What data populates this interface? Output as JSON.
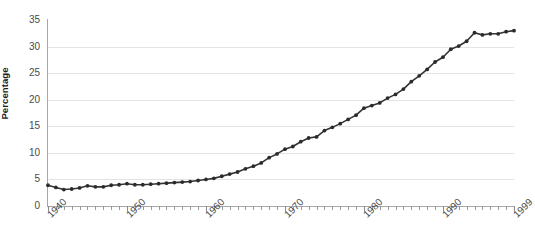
{
  "chart_data": {
    "type": "line",
    "title": "",
    "subtitle": "",
    "xlabel": "",
    "ylabel": "Percentage",
    "xlim": [
      1940,
      1999
    ],
    "ylim": [
      0,
      35
    ],
    "grid": true,
    "grid_axis": "y",
    "legend": false,
    "legend_position": "none",
    "marker": "circle",
    "line_color": "#333333",
    "marker_color": "#2b2b2b",
    "grid_color": "#e3e3e3",
    "axis_color": "#a8a8a8",
    "tick_label_color": "#4a4a4a",
    "y_ticks": [
      0,
      5,
      10,
      15,
      20,
      25,
      30,
      35
    ],
    "y_tick_labels": [
      "0",
      "5",
      "10",
      "15",
      "20",
      "25",
      "30",
      "35"
    ],
    "y_gridlines": [
      5,
      10,
      15,
      20,
      25,
      30
    ],
    "x_ticks": [
      1940,
      1950,
      1960,
      1970,
      1980,
      1990,
      1999
    ],
    "x_tick_labels": [
      "1940",
      "1950",
      "1960",
      "1970",
      "1980",
      "1990",
      "1999"
    ],
    "x_minor_tick_interval": 1,
    "x": [
      1940,
      1941,
      1942,
      1943,
      1944,
      1945,
      1946,
      1947,
      1948,
      1949,
      1950,
      1951,
      1952,
      1953,
      1954,
      1955,
      1956,
      1957,
      1958,
      1959,
      1960,
      1961,
      1962,
      1963,
      1964,
      1965,
      1966,
      1967,
      1968,
      1969,
      1970,
      1971,
      1972,
      1973,
      1974,
      1975,
      1976,
      1977,
      1978,
      1979,
      1980,
      1981,
      1982,
      1983,
      1984,
      1985,
      1986,
      1987,
      1988,
      1989,
      1990,
      1991,
      1992,
      1993,
      1994,
      1995,
      1996,
      1997,
      1998,
      1999
    ],
    "values": [
      3.9,
      3.5,
      3.1,
      3.2,
      3.4,
      3.8,
      3.6,
      3.6,
      3.9,
      4.0,
      4.2,
      4.0,
      4.0,
      4.1,
      4.2,
      4.3,
      4.4,
      4.5,
      4.6,
      4.8,
      5.0,
      5.2,
      5.6,
      6.0,
      6.4,
      7.0,
      7.5,
      8.1,
      9.1,
      9.8,
      10.7,
      11.2,
      12.1,
      12.8,
      13.0,
      14.2,
      14.8,
      15.5,
      16.3,
      17.1,
      18.4,
      18.9,
      19.4,
      20.3,
      21.0,
      22.0,
      23.4,
      24.5,
      25.7,
      27.1,
      28.0,
      29.5,
      30.1,
      31.0,
      32.6,
      32.2,
      32.4,
      32.4,
      32.8,
      33.0
    ]
  }
}
